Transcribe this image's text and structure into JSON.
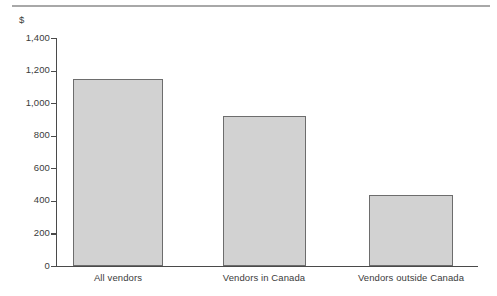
{
  "chart_data": {
    "type": "bar",
    "title": "",
    "subtitle": "",
    "xlabel": "",
    "ylabel": "$",
    "unit_label": "$",
    "categories": [
      "All vendors",
      "Vendors in Canada",
      "Vendors outside Canada"
    ],
    "values": [
      1150,
      920,
      435
    ],
    "ylim": [
      0,
      1400
    ],
    "ytick_labels": [
      "1,400",
      "1,200",
      "1,000",
      "800",
      "600",
      "400",
      "200",
      "0"
    ],
    "ytick_values": [
      1400,
      1200,
      1000,
      800,
      600,
      400,
      200,
      0
    ],
    "grid": false,
    "legend": null,
    "legend_position": "none",
    "annotations": [],
    "colors": {
      "bar_fill": "#d2d2d2",
      "bar_stroke": "#6d6d6d",
      "axis": "#4a4a4a",
      "text": "#3b3b3b",
      "rule": "#a8a8a8",
      "background": "#ffffff"
    }
  }
}
